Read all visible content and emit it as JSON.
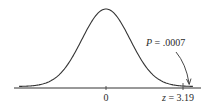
{
  "chart_data": {
    "type": "line",
    "title": "",
    "xlabel": "",
    "ylabel": "",
    "x_ticks": [
      {
        "value": 0,
        "label": "0"
      },
      {
        "value": 3.19,
        "label": "z = 3.19"
      }
    ],
    "annotation": {
      "text": "P = .0007",
      "points_to": "right tail beyond z = 3.19"
    },
    "curve": "normal density, mean 0, sd 1",
    "xlim": [
      -3.6,
      3.6
    ],
    "grid": false,
    "legend": "none"
  },
  "labels": {
    "zero": "0",
    "z_var": "z",
    "z_eq": " = 3.19",
    "p_var": "P",
    "p_eq": " = .0007"
  },
  "colors": {
    "curve": "#333333",
    "axis": "#333333",
    "text": "#2a2a2a"
  }
}
